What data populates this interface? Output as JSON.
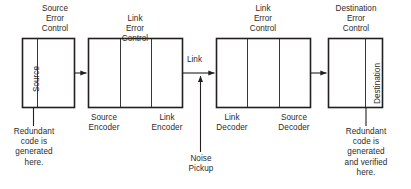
{
  "diagram": {
    "stroke_color": "#231f20",
    "text_color": "#2b2b2b",
    "background": "#ffffff",
    "blocks": [
      {
        "id": "source-error-control",
        "title": "Source\nError\nControl",
        "vertical_label": "Source",
        "sections": []
      },
      {
        "id": "link-error-control-transmit",
        "title": "Link\nError\nControl",
        "vertical_label": "",
        "sections": [
          "Source\nEncoder",
          "Link\nEncoder"
        ]
      },
      {
        "id": "link-error-control-receive",
        "title": "Link\nError\nControl",
        "vertical_label": "",
        "sections": [
          "Link\nDecoder",
          "Source\nDecoder"
        ]
      },
      {
        "id": "destination-error-control",
        "title": "Destination\nError\nControl",
        "vertical_label": "Destination",
        "sections": []
      }
    ],
    "edge_labels": {
      "link": "Link",
      "noise_pickup": "Noise\nPickup"
    },
    "captions": {
      "left": "Redundant\ncode is\ngenerated\nhere.",
      "right": "Redundant\ncode is\ngenerated\nand verified\nhere."
    }
  }
}
